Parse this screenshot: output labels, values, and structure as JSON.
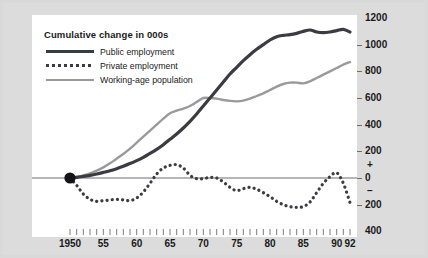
{
  "chart_data": {
    "type": "line",
    "title": "Cumulative change in 000s",
    "xlabel": "",
    "ylabel": "Cumulative change in 000s",
    "grid": false,
    "legend_position": "top-left",
    "xlim": [
      1950,
      1992
    ],
    "ylim": [
      -400,
      1200
    ],
    "y_ticks": [
      1200,
      1000,
      800,
      600,
      400,
      200,
      0,
      -200,
      -400
    ],
    "y_tick_labels": [
      "1200",
      "1000",
      "800",
      "600",
      "400",
      "200",
      "0",
      "200",
      "400"
    ],
    "y_sign_markers": [
      "+",
      "–"
    ],
    "x_ticks": [
      1950,
      1955,
      1960,
      1965,
      1970,
      1975,
      1980,
      1985,
      1990,
      1992
    ],
    "x_tick_labels": [
      "1950",
      "55",
      "60",
      "65",
      "70",
      "75",
      "80",
      "85",
      "90",
      "92"
    ],
    "x_minor_tick_interval": 1,
    "origin_marker": {
      "x": 1950,
      "y": 0,
      "style": "filled-circle"
    },
    "series": [
      {
        "name": "Public employment",
        "style": "solid",
        "color": "#3b3b42",
        "width": 3.2,
        "x": [
          1950,
          1951,
          1952,
          1953,
          1954,
          1955,
          1956,
          1957,
          1958,
          1959,
          1960,
          1961,
          1962,
          1963,
          1964,
          1965,
          1966,
          1967,
          1968,
          1969,
          1970,
          1971,
          1972,
          1973,
          1974,
          1975,
          1976,
          1977,
          1978,
          1979,
          1980,
          1981,
          1982,
          1983,
          1984,
          1985,
          1986,
          1987,
          1988,
          1989,
          1990,
          1991,
          1992
        ],
        "values": [
          0,
          5,
          12,
          20,
          30,
          42,
          55,
          70,
          88,
          108,
          130,
          155,
          185,
          215,
          250,
          290,
          330,
          375,
          425,
          480,
          540,
          600,
          660,
          720,
          780,
          830,
          880,
          925,
          965,
          1000,
          1035,
          1060,
          1070,
          1075,
          1085,
          1100,
          1110,
          1095,
          1090,
          1095,
          1105,
          1115,
          1095
        ]
      },
      {
        "name": "Private employment",
        "style": "dotted",
        "color": "#3b3b42",
        "width": 3.2,
        "x": [
          1950,
          1951,
          1952,
          1953,
          1954,
          1955,
          1956,
          1957,
          1958,
          1959,
          1960,
          1961,
          1962,
          1963,
          1964,
          1965,
          1966,
          1967,
          1968,
          1969,
          1970,
          1971,
          1972,
          1973,
          1974,
          1975,
          1976,
          1977,
          1978,
          1979,
          1980,
          1981,
          1982,
          1983,
          1984,
          1985,
          1986,
          1987,
          1988,
          1989,
          1990,
          1991,
          1992
        ],
        "values": [
          0,
          -55,
          -120,
          -160,
          -175,
          -170,
          -165,
          -160,
          -165,
          -170,
          -150,
          -105,
          -40,
          30,
          75,
          95,
          100,
          75,
          20,
          -5,
          -5,
          5,
          0,
          -30,
          -70,
          -95,
          -80,
          -70,
          -85,
          -110,
          -140,
          -175,
          -200,
          -215,
          -220,
          -215,
          -180,
          -110,
          -40,
          10,
          40,
          -40,
          -185
        ]
      },
      {
        "name": "Working-age population",
        "style": "solid",
        "color": "#9a9a9a",
        "width": 2.4,
        "x": [
          1950,
          1951,
          1952,
          1953,
          1954,
          1955,
          1956,
          1957,
          1958,
          1959,
          1960,
          1961,
          1962,
          1963,
          1964,
          1965,
          1966,
          1967,
          1968,
          1969,
          1970,
          1971,
          1972,
          1973,
          1974,
          1975,
          1976,
          1977,
          1978,
          1979,
          1980,
          1981,
          1982,
          1983,
          1984,
          1985,
          1986,
          1987,
          1988,
          1989,
          1990,
          1991,
          1992
        ],
        "values": [
          0,
          8,
          20,
          35,
          55,
          80,
          110,
          145,
          180,
          220,
          265,
          310,
          355,
          400,
          445,
          485,
          505,
          520,
          540,
          570,
          600,
          600,
          595,
          585,
          578,
          575,
          580,
          595,
          615,
          635,
          660,
          685,
          705,
          715,
          715,
          710,
          725,
          750,
          775,
          800,
          825,
          850,
          870
        ]
      }
    ]
  },
  "legend": {
    "title": "Cumulative change in 000s",
    "items": [
      {
        "label": "Public employment",
        "swatch": "solid-thick-dark"
      },
      {
        "label": "Private employment",
        "swatch": "dotted-thick-dark"
      },
      {
        "label": "Working-age population",
        "swatch": "solid-thin-gray"
      }
    ]
  },
  "colors": {
    "mount_background": "#d9d9d9",
    "plot_background": "#ffffff",
    "public_employment": "#3b3b42",
    "private_employment": "#3b3b42",
    "working_age_population": "#9a9a9a",
    "axis": "#6e6e6e",
    "text": "#1a1a1a"
  }
}
